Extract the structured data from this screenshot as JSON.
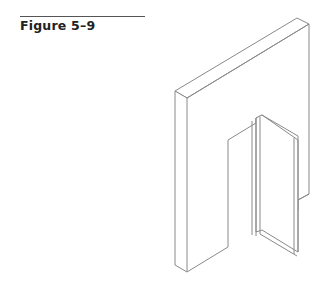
{
  "figure": {
    "caption": "Figure 5–9",
    "illustration": "isometric-wall-with-door-opening",
    "line_color": "#888888"
  }
}
